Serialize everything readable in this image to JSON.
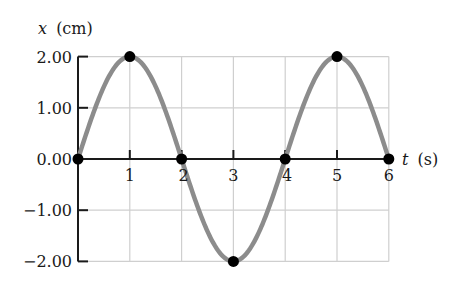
{
  "chart_data": {
    "type": "line",
    "title": "",
    "xlabel": "t (s)",
    "ylabel": "x (cm)",
    "xlabel_var": "t",
    "xlabel_unit": "(s)",
    "ylabel_var": "x",
    "ylabel_unit": "(cm)",
    "xlim": [
      0,
      6
    ],
    "ylim": [
      -2,
      2
    ],
    "x_ticks": [
      "1",
      "2",
      "3",
      "4",
      "5",
      "6"
    ],
    "y_ticks": [
      "2.00",
      "1.00",
      "0.00",
      "−1.00",
      "−2.00"
    ],
    "grid": true,
    "curve": {
      "function": "x = 2.00 sin(pi t / 2)",
      "amplitude": 2.0,
      "period": 4.0,
      "color": "#8c8c8c"
    },
    "series": [
      {
        "name": "marked points",
        "x": [
          0,
          1,
          2,
          3,
          4,
          5,
          6
        ],
        "y": [
          0.0,
          2.0,
          0.0,
          -2.0,
          0.0,
          2.0,
          0.0
        ],
        "color": "#000000"
      }
    ]
  }
}
